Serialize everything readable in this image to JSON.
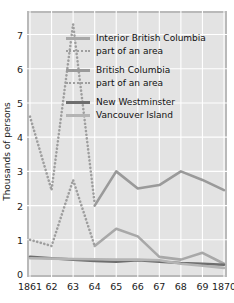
{
  "chart_data": {
    "type": "line",
    "title": "",
    "xlabel": "",
    "ylabel": "Thousands of persons",
    "x": [
      1861,
      1862,
      1863,
      1864,
      1865,
      1866,
      1867,
      1868,
      1869,
      1870
    ],
    "xticklabels": [
      "1861",
      "62",
      "63",
      "64",
      "65",
      "66",
      "67",
      "68",
      "69",
      "1870"
    ],
    "yticklabels": [
      "0",
      "1",
      "2",
      "3",
      "4",
      "5",
      "6",
      "7"
    ],
    "ytickvalues": [
      0,
      1,
      2,
      3,
      4,
      5,
      6,
      7
    ],
    "xlim": [
      1861,
      1870
    ],
    "ylim": [
      0,
      7.6
    ],
    "grid": true,
    "legend_position": "upper-right-inside",
    "series": [
      {
        "name": "Interior British Columbia",
        "style": "solid",
        "color": "#a8a8a8",
        "x": [
          1864,
          1865,
          1866,
          1867,
          1868,
          1869,
          1870
        ],
        "values": [
          0.82,
          1.32,
          1.1,
          0.5,
          0.42,
          0.62,
          0.3
        ]
      },
      {
        "name": "part of an area",
        "legend_for": "Interior British Columbia",
        "style": "dotted",
        "color": "#9e9e9e",
        "x": [
          1861,
          1862,
          1863,
          1864
        ],
        "values": [
          1.0,
          0.82,
          2.75,
          0.82
        ]
      },
      {
        "name": "British Columbia",
        "style": "solid",
        "color": "#9a9a9a",
        "x": [
          1864,
          1865,
          1866,
          1867,
          1868,
          1869,
          1870
        ],
        "values": [
          2.0,
          3.0,
          2.5,
          2.6,
          3.0,
          2.75,
          2.45
        ]
      },
      {
        "name": "part of an area",
        "legend_for": "British Columbia",
        "style": "dotted",
        "color": "#9e9e9e",
        "x": [
          1861,
          1862,
          1863,
          1864
        ],
        "values": [
          4.6,
          2.45,
          7.3,
          2.05
        ]
      },
      {
        "name": "New Westminster",
        "style": "solid",
        "color": "#6e6e6e",
        "x": [
          1861,
          1862,
          1863,
          1864,
          1865,
          1866,
          1867,
          1868,
          1869,
          1870
        ],
        "values": [
          0.5,
          0.46,
          0.42,
          0.38,
          0.36,
          0.4,
          0.36,
          0.32,
          0.3,
          0.27
        ]
      },
      {
        "name": "Vancouver Island",
        "style": "solid",
        "color": "#b4b4b4",
        "x": [
          1861,
          1862,
          1863,
          1864,
          1865,
          1866,
          1867,
          1868,
          1869,
          1870
        ],
        "values": [
          0.46,
          0.45,
          0.44,
          0.43,
          0.42,
          0.42,
          0.4,
          0.3,
          0.24,
          0.18
        ]
      }
    ],
    "legend_entries": [
      {
        "label": "Interior British Columbia",
        "style": "solid",
        "color": "#a8a8a8"
      },
      {
        "label": "part of an area",
        "style": "dotted",
        "color": "#9e9e9e"
      },
      {
        "label": "British Columbia",
        "style": "solid",
        "color": "#9a9a9a"
      },
      {
        "label": "part of an area",
        "style": "dotted",
        "color": "#9e9e9e"
      },
      {
        "label": "New Westminster",
        "style": "solid",
        "color": "#6e6e6e"
      },
      {
        "label": "Vancouver Island",
        "style": "solid",
        "color": "#b4b4b4"
      }
    ]
  }
}
